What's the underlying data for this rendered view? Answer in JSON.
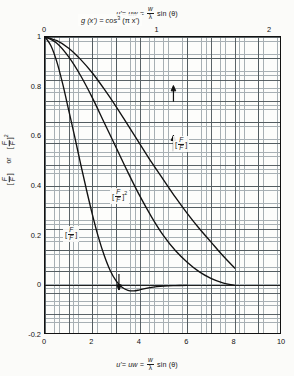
{
  "figure": {
    "top_axis_title": {
      "lhs": "u'= uw =",
      "num": "w",
      "den": "λ",
      "rhs": "sin (θ)"
    },
    "bottom_axis_title": {
      "lhs": "u'= uw =",
      "num": "w",
      "den": "λ",
      "rhs": "sin (θ)"
    },
    "annotation": {
      "lhs": "g (x') = cos",
      "exponent": "3",
      "rhs": "(π x')"
    },
    "y_axis_title": {
      "first_num": "F",
      "first_den": "F",
      "first_sub": "m",
      "connector": "or",
      "second_num": "F",
      "second_den": "F",
      "second_sub": "m",
      "second_exponent": "2"
    },
    "curve_labels": [
      {
        "num": "F",
        "den": "F",
        "sub": "m",
        "exponent": ""
      },
      {
        "num": "F",
        "den": "F",
        "sub": "m",
        "exponent": "2"
      },
      {
        "num": "F",
        "den": "F",
        "sub": "m",
        "exponent": ""
      }
    ]
  },
  "chart_data": {
    "type": "line",
    "title": "",
    "xlabel": "u' = uw = (w/λ) sin(θ)",
    "ylabel": "[F/F_m] or [F/F_m]^2",
    "xlim": [
      0,
      10
    ],
    "ylim": [
      -0.2,
      1.0
    ],
    "grid": true,
    "legend_position": "in-plot annotations",
    "top_axis": {
      "label": "u' = uw = (w/λ) sin(θ)",
      "ticks": [
        0,
        1,
        2
      ],
      "tick_labels": [
        "0",
        "1",
        "2"
      ],
      "range": [
        0,
        2.105
      ],
      "note": "secondary x' scale, x' = u'/4.75"
    },
    "bottom_axis": {
      "ticks": [
        0,
        2,
        4,
        6,
        8,
        10
      ],
      "tick_labels": [
        "0",
        "2",
        "4",
        "6",
        "8",
        "10"
      ]
    },
    "y_axis": {
      "ticks": [
        1,
        0.8,
        0.6,
        0.4,
        0.2,
        0,
        -0.2
      ],
      "tick_labels": [
        "1",
        "0.8",
        "0.6",
        "0.4",
        "0.2",
        "0",
        "-0.2"
      ]
    },
    "series": [
      {
        "name": "[F/F_m] steep",
        "label": "[F/F_m]",
        "x": [
          0,
          0.25,
          0.5,
          0.75,
          1.0,
          1.25,
          1.5,
          1.75,
          2.0,
          2.25,
          2.5,
          2.75,
          3.0,
          3.25,
          3.5,
          3.75,
          4.0,
          4.5,
          5.0,
          5.5,
          6.0
        ],
        "y": [
          1.0,
          0.965,
          0.9,
          0.81,
          0.705,
          0.6,
          0.49,
          0.385,
          0.285,
          0.195,
          0.12,
          0.06,
          0.018,
          -0.008,
          -0.02,
          -0.022,
          -0.018,
          -0.008,
          -0.003,
          -0.001,
          0.0
        ]
      },
      {
        "name": "[F/F_m]^2",
        "label": "[F/F_m]^2",
        "x": [
          0,
          0.5,
          1.0,
          1.5,
          2.0,
          2.5,
          3.0,
          3.5,
          4.0,
          4.5,
          5.0,
          5.5,
          6.0,
          6.5,
          7.0,
          7.5,
          8.0
        ],
        "y": [
          1.0,
          0.975,
          0.92,
          0.845,
          0.755,
          0.655,
          0.555,
          0.455,
          0.36,
          0.275,
          0.2,
          0.14,
          0.093,
          0.055,
          0.028,
          0.01,
          0.0
        ]
      },
      {
        "name": "[F/F_m] gentle",
        "label": "[F/F_m]",
        "x": [
          0,
          0.5,
          1.0,
          1.5,
          2.0,
          2.5,
          3.0,
          3.5,
          4.0,
          4.5,
          5.0,
          5.5,
          6.0,
          6.5,
          7.0,
          7.5,
          8.0
        ],
        "y": [
          1.0,
          0.985,
          0.955,
          0.91,
          0.855,
          0.79,
          0.72,
          0.645,
          0.57,
          0.495,
          0.425,
          0.355,
          0.29,
          0.23,
          0.175,
          0.12,
          0.07
        ]
      }
    ],
    "markers": [
      {
        "name": "arrow-up-upper-curve",
        "direction": "up",
        "x": 5.42,
        "y": 0.8
      },
      {
        "name": "arrow-up-middle-curve",
        "direction": "up",
        "x": 5.42,
        "y": 0.6
      },
      {
        "name": "arrow-down-steep-curve",
        "direction": "down",
        "x": 3.12,
        "y": -0.015
      }
    ]
  }
}
